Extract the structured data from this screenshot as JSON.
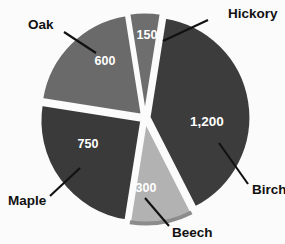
{
  "chart_data": {
    "type": "pie",
    "title": "",
    "categories": [
      "Hickory",
      "Birch",
      "Beech",
      "Maple",
      "Oak"
    ],
    "values": [
      150,
      1200,
      300,
      750,
      600
    ],
    "total": 3000,
    "value_labels": [
      "150",
      "1,200",
      "300",
      "750",
      "600"
    ],
    "legend_position": "callout-labels",
    "grid": false,
    "slices": [
      {
        "name": "Hickory",
        "label": "Hickory",
        "value": 150,
        "value_label": "150",
        "percent": 5,
        "start_angle": -9,
        "sweep_angle": 18,
        "color": "#6e6e6e",
        "exploded": true,
        "label_x": 228,
        "label_y": 14,
        "value_x": 147,
        "value_y": 36,
        "leader": {
          "x1": 208,
          "y1": 20,
          "x2": 163,
          "y2": 41
        }
      },
      {
        "name": "Birch",
        "label": "Birch",
        "value": 1200,
        "value_label": "1,200",
        "percent": 40,
        "start_angle": 9,
        "sweep_angle": 144,
        "color": "#3c3c3c",
        "exploded": true,
        "label_x": 252,
        "label_y": 190,
        "value_x": 207,
        "value_y": 122,
        "leader": {
          "x1": 248,
          "y1": 184,
          "x2": 219,
          "y2": 143
        }
      },
      {
        "name": "Beech",
        "label": "Beech",
        "value": 300,
        "value_label": "300",
        "percent": 10,
        "start_angle": 153,
        "sweep_angle": 36,
        "color": "#b2b2b2",
        "exploded": true,
        "label_x": 172,
        "label_y": 233,
        "value_x": 146,
        "value_y": 189,
        "leader": {
          "x1": 169,
          "y1": 226,
          "x2": 145,
          "y2": 198
        }
      },
      {
        "name": "Maple",
        "label": "Maple",
        "value": 750,
        "value_label": "750",
        "percent": 25,
        "start_angle": 189,
        "sweep_angle": 90,
        "color": "#3a3a3a",
        "exploded": true,
        "label_x": 8,
        "label_y": 201,
        "value_x": 88,
        "value_y": 145,
        "leader": {
          "x1": 50,
          "y1": 196,
          "x2": 80,
          "y2": 168
        }
      },
      {
        "name": "Oak",
        "label": "Oak",
        "value": 600,
        "value_label": "600",
        "percent": 20,
        "start_angle": 279,
        "sweep_angle": 72,
        "color": "#6a6a6a",
        "exploded": true,
        "label_x": 28,
        "label_y": 25,
        "value_x": 105,
        "value_y": 62,
        "leader": {
          "x1": 64,
          "y1": 32,
          "x2": 96,
          "y2": 53
        }
      }
    ],
    "geometry": {
      "center_x": 145,
      "center_y": 118,
      "radius": 101,
      "explode_offset": 4.5
    },
    "background_color": "#fbfbfb",
    "label_color": "#111111",
    "value_color": "#ffffff"
  }
}
